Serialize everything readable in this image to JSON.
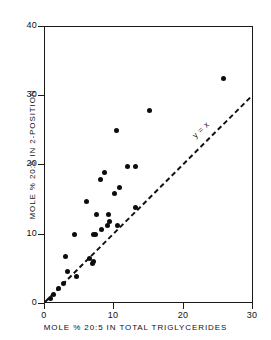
{
  "chart_data": {
    "type": "scatter",
    "title": "",
    "xlabel": "MOLE % 20:5 IN TOTAL TRIGLYCERIDES",
    "ylabel": "MOLE % 20:5 IN 2-POSITION",
    "xlim": [
      0,
      30
    ],
    "ylim": [
      0,
      40
    ],
    "xticks": [
      0,
      10,
      20,
      30
    ],
    "yticks": [
      0,
      10,
      20,
      30,
      40
    ],
    "xtick_labels": [
      "0",
      "10",
      "20",
      "30"
    ],
    "ytick_labels": [
      "0",
      "10",
      "20",
      "30",
      "40"
    ],
    "grid": false,
    "legend": "none",
    "points": [
      {
        "x": 0.8,
        "y": 0.8
      },
      {
        "x": 1.2,
        "y": 1.3
      },
      {
        "x": 2.0,
        "y": 2.2
      },
      {
        "x": 2.6,
        "y": 3.0
      },
      {
        "x": 3.0,
        "y": 6.9
      },
      {
        "x": 3.2,
        "y": 4.7
      },
      {
        "x": 4.3,
        "y": 10.0
      },
      {
        "x": 4.5,
        "y": 3.9
      },
      {
        "x": 5.9,
        "y": 14.8
      },
      {
        "x": 6.4,
        "y": 6.5
      },
      {
        "x": 6.8,
        "y": 5.9
      },
      {
        "x": 6.9,
        "y": 6.1
      },
      {
        "x": 6.9,
        "y": 10.0
      },
      {
        "x": 7.3,
        "y": 10.0
      },
      {
        "x": 7.4,
        "y": 12.9
      },
      {
        "x": 7.9,
        "y": 18.0
      },
      {
        "x": 8.1,
        "y": 10.8
      },
      {
        "x": 8.5,
        "y": 19.0
      },
      {
        "x": 9.0,
        "y": 11.3
      },
      {
        "x": 9.1,
        "y": 12.9
      },
      {
        "x": 9.2,
        "y": 11.9
      },
      {
        "x": 10.0,
        "y": 16.0
      },
      {
        "x": 10.3,
        "y": 25.0
      },
      {
        "x": 10.4,
        "y": 11.3
      },
      {
        "x": 10.7,
        "y": 16.8
      },
      {
        "x": 11.8,
        "y": 19.9
      },
      {
        "x": 13.0,
        "y": 19.9
      },
      {
        "x": 13.0,
        "y": 13.9
      },
      {
        "x": 15.0,
        "y": 27.9
      },
      {
        "x": 25.6,
        "y": 32.6
      }
    ],
    "reference_line": {
      "label": "y = x",
      "style": "dashed",
      "from": [
        0,
        0
      ],
      "to": [
        30,
        30
      ]
    },
    "marker_color": "#0d0d0d",
    "axis_color": "#1a1a1a"
  }
}
